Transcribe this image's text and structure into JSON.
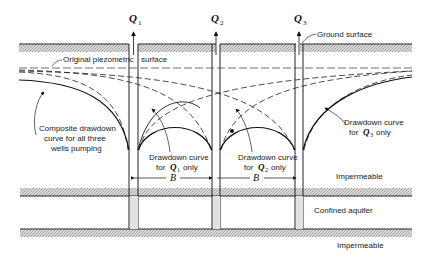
{
  "diagram": {
    "type": "multiple-well drawdown in confined aquifer",
    "wells": [
      {
        "label": "Q",
        "sub": "1"
      },
      {
        "label": "Q",
        "sub": "2"
      },
      {
        "label": "Q",
        "sub": "3"
      }
    ],
    "labels": {
      "ground_surface": "Ground surface",
      "original_piezometric": "Original piezometric",
      "surface_word": "surface",
      "composite_1": "Composite drawdown",
      "composite_2": "curve for all three",
      "composite_3": "wells pumping",
      "q1_curve_1": "Drawdown curve",
      "q1_curve_2": "for",
      "q1_curve_3": "only",
      "q2_curve_1": "Drawdown curve",
      "q2_curve_2": "for",
      "q2_curve_3": "only",
      "q3_curve_1": "Drawdown curve",
      "q3_curve_2": "for",
      "q3_curve_3": "only",
      "impermeable_top": "Impermeable",
      "confined_aquifer": "Confined aquifer",
      "impermeable_bottom": "Impermeable",
      "spacing": "B"
    }
  }
}
